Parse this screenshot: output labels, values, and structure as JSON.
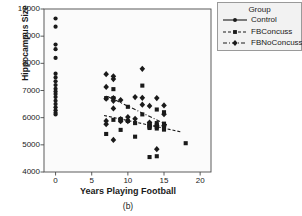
{
  "figure": {
    "caption": "(b)"
  },
  "chart_data": {
    "type": "scatter",
    "title": "",
    "xlabel": "Years Playing Football",
    "ylabel": "Hippocampus Size",
    "xlim": [
      -1.6,
      21.5
    ],
    "ylim": [
      4000,
      10000
    ],
    "xticks": [
      0,
      5,
      10,
      15,
      20
    ],
    "xtick_labels": [
      "0",
      "5",
      "10",
      "15",
      "20"
    ],
    "yticks": [
      4000,
      5000,
      6000,
      7000,
      8000,
      9000,
      10000
    ],
    "ytick_labels": [
      "4000",
      "5000",
      "6000",
      "7000",
      "8000",
      "9000",
      "10000"
    ],
    "grid": false,
    "legend_position": "outside-right-top",
    "legend_title": "Group",
    "series": [
      {
        "name": "Control",
        "marker": "circle",
        "line_style": "solid",
        "color": "#1a1a1a",
        "points": [
          [
            0,
            9650
          ],
          [
            0,
            9350
          ],
          [
            0,
            8690
          ],
          [
            0,
            8520
          ],
          [
            0,
            8200
          ],
          [
            0,
            7620
          ],
          [
            0,
            7480
          ],
          [
            0,
            7340
          ],
          [
            0,
            7200
          ],
          [
            0,
            7060
          ],
          [
            0,
            6960
          ],
          [
            0,
            6870
          ],
          [
            0,
            6760
          ],
          [
            0,
            6620
          ],
          [
            0,
            6500
          ],
          [
            0,
            6380
          ],
          [
            0,
            6270
          ],
          [
            0,
            6180
          ],
          [
            0,
            6120
          ]
        ]
      },
      {
        "name": "FBConcuss",
        "marker": "square",
        "line_style": "dashed",
        "color": "#1a1a1a",
        "points": [
          [
            7,
            6720
          ],
          [
            7,
            5400
          ],
          [
            8,
            7050
          ],
          [
            8,
            6720
          ],
          [
            8,
            5920
          ],
          [
            9,
            5950
          ],
          [
            9,
            5900
          ],
          [
            9,
            5550
          ],
          [
            10,
            6400
          ],
          [
            10,
            5880
          ],
          [
            11,
            5800
          ],
          [
            11,
            5300
          ],
          [
            12,
            7180
          ],
          [
            12,
            6120
          ],
          [
            13,
            5780
          ],
          [
            13,
            5740
          ],
          [
            13,
            5700
          ],
          [
            13,
            5660
          ],
          [
            13,
            5620
          ],
          [
            13,
            4550
          ],
          [
            14,
            6300
          ],
          [
            14,
            5800
          ],
          [
            14,
            5720
          ],
          [
            14,
            5660
          ],
          [
            14,
            5600
          ],
          [
            14,
            4580
          ],
          [
            15,
            6200
          ],
          [
            15,
            5780
          ],
          [
            15,
            5700
          ],
          [
            15,
            5640
          ],
          [
            15,
            5560
          ],
          [
            18,
            5060
          ]
        ],
        "trend": {
          "x0": 6.7,
          "y0": 6080,
          "x1": 17.3,
          "y1": 5480
        }
      },
      {
        "name": "FBNoConcuss",
        "marker": "diamond",
        "line_style": "dash-dot",
        "color": "#1a1a1a",
        "points": [
          [
            7,
            7600
          ],
          [
            7,
            7130
          ],
          [
            7,
            6700
          ],
          [
            7,
            5880
          ],
          [
            7,
            5760
          ],
          [
            8,
            7520
          ],
          [
            8,
            7420
          ],
          [
            8,
            6720
          ],
          [
            8,
            6620
          ],
          [
            8,
            6340
          ],
          [
            8,
            5180
          ],
          [
            9,
            6650
          ],
          [
            9,
            5950
          ],
          [
            9,
            5870
          ],
          [
            10,
            6020
          ],
          [
            10,
            5870
          ],
          [
            11,
            6760
          ],
          [
            11,
            5960
          ],
          [
            12,
            7800
          ],
          [
            12,
            6730
          ],
          [
            12,
            6480
          ],
          [
            13,
            6430
          ],
          [
            13,
            5820
          ],
          [
            14,
            6720
          ],
          [
            14,
            5700
          ],
          [
            14,
            4840
          ],
          [
            15,
            6450
          ],
          [
            15,
            6130
          ],
          [
            15,
            5700
          ]
        ],
        "trend": {
          "x0": 7.2,
          "y0": 6780,
          "x1": 15.4,
          "y1": 5740
        }
      }
    ]
  }
}
